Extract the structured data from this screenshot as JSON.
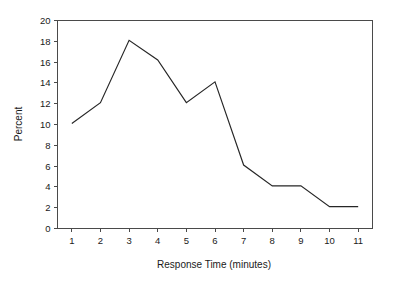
{
  "chart_data": {
    "type": "line",
    "title": "",
    "xlabel": "Response Time (minutes)",
    "ylabel": "Percent",
    "x": [
      1,
      2,
      3,
      4,
      5,
      6,
      7,
      8,
      9,
      10,
      11
    ],
    "values": [
      10.1,
      12.1,
      18.1,
      16.2,
      12.1,
      14.1,
      6.1,
      4.1,
      4.1,
      2.1,
      2.1
    ],
    "xtick_labels": [
      "1",
      "2",
      "3",
      "4",
      "5",
      "6",
      "7",
      "8",
      "9",
      "10",
      "11"
    ],
    "ytick_labels": [
      "0",
      "2",
      "4",
      "6",
      "8",
      "10",
      "12",
      "14",
      "16",
      "18",
      "20"
    ],
    "yticks": [
      0,
      2,
      4,
      6,
      8,
      10,
      12,
      14,
      16,
      18,
      20
    ],
    "xlim": [
      0.5,
      11.5
    ],
    "ylim": [
      0,
      20
    ],
    "grid": false,
    "legend": false,
    "series_color": "#262626",
    "axis_color": "#4a4a4a",
    "background_color": "#ffffff"
  }
}
